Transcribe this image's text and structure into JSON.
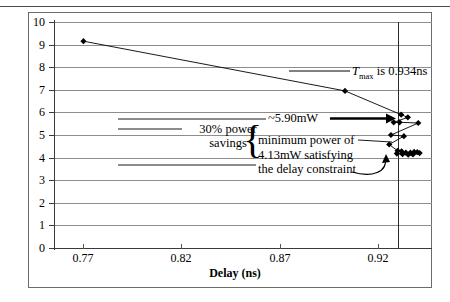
{
  "figure": {
    "y_axis_title": "Power for c1355 at 1.2Tmin (mW)",
    "x_axis_title": "Delay (ns)"
  },
  "annotations": {
    "tmax_prefix": "T",
    "tmax_sub": "max",
    "tmax_rest": " is 0.934ns",
    "power_5_90": "~5.90mW",
    "savings": "30% power savings",
    "minimum_power": "minimum power of 4.13mW satisfying the delay constraint",
    "minimum_power_l1": "minimum power of",
    "minimum_power_l2": "4.13mW satisfying",
    "minimum_power_l3": "the delay constraint",
    "brace_glyph": "{"
  },
  "chart_data": {
    "type": "scatter",
    "title": "",
    "xlabel": "Delay (ns)",
    "ylabel": "Power for c1355 at 1.2Tmin (mW)",
    "xlim": [
      0.757,
      0.9495
    ],
    "ylim": [
      0,
      10
    ],
    "xticks": [
      0.77,
      0.82,
      0.87,
      0.92
    ],
    "xtick_labels": [
      "0.77",
      "0.82",
      "0.87",
      "0.92"
    ],
    "yticks": [
      0,
      1,
      2,
      3,
      4,
      5,
      6,
      7,
      8,
      9,
      10
    ],
    "ytick_labels": [
      "0",
      "1",
      "2",
      "3",
      "4",
      "5",
      "6",
      "7",
      "8",
      "9",
      "10"
    ],
    "grid": true,
    "legend": "none",
    "marker": "diamond",
    "marker_color": "#000000",
    "line_color": "#000000",
    "series": [
      {
        "name": "power-delay tradeoff curve",
        "points": [
          [
            0.772,
            9.15
          ],
          [
            0.9052,
            6.95
          ],
          [
            0.9338,
            5.9
          ],
          [
            0.9372,
            5.78
          ],
          [
            0.93,
            5.56
          ],
          [
            0.933,
            5.56
          ],
          [
            0.9425,
            5.53
          ],
          [
            0.9286,
            5.0
          ],
          [
            0.9352,
            4.95
          ],
          [
            0.9277,
            4.58
          ],
          [
            0.932,
            4.3
          ],
          [
            0.934,
            4.28
          ],
          [
            0.9362,
            4.22
          ],
          [
            0.9385,
            4.22
          ],
          [
            0.9404,
            4.25
          ],
          [
            0.942,
            4.24
          ],
          [
            0.9316,
            4.18
          ],
          [
            0.9345,
            4.15
          ],
          [
            0.9374,
            4.13
          ],
          [
            0.9398,
            4.14
          ],
          [
            0.9432,
            4.2
          ]
        ]
      }
    ],
    "reference_lines": [
      {
        "name": "Tmax delay constraint",
        "orientation": "vertical",
        "value": 0.934,
        "label": "Tmax is 0.934ns"
      }
    ],
    "callouts": [
      {
        "text": "~5.90mW",
        "points_to": [
          0.9338,
          5.9
        ]
      },
      {
        "text": "minimum power of 4.13mW satisfying the delay constraint",
        "points_to": [
          0.9374,
          4.13
        ]
      },
      {
        "text": "30% power savings",
        "range_y": [
          4.13,
          5.9
        ]
      }
    ]
  }
}
